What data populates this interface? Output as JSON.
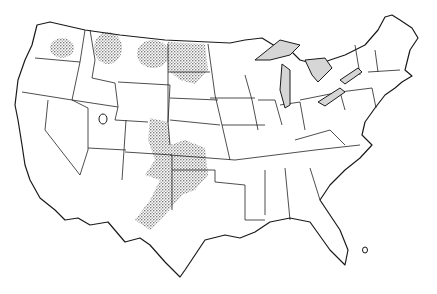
{
  "map": {
    "subject": "Contiguous United States outline map with state boundaries",
    "style": "black and white line drawing",
    "shaded_features": [
      {
        "name": "Great Lakes",
        "fill": "light gray hatched"
      },
      {
        "name": "Lake Champlain / Lake Ontario region",
        "fill": "light gray hatched"
      }
    ],
    "stippled_regions": [
      {
        "name": "Eastern Washington"
      },
      {
        "name": "Northwestern Montana"
      },
      {
        "name": "Northeastern Montana"
      },
      {
        "name": "North Dakota / northern South Dakota"
      },
      {
        "name": "Eastern Colorado"
      },
      {
        "name": "Western Kansas"
      },
      {
        "name": "Oklahoma / Texas Panhandle"
      },
      {
        "name": "Eastern New Mexico"
      }
    ],
    "other_marks": [
      {
        "name": "Great Salt Lake outline (Utah)"
      },
      {
        "name": "Lake Okeechobee outline (Florida)"
      }
    ],
    "colors": {
      "line": "#1a1a1a",
      "lake_fill": "#d6d6d6",
      "background": "#ffffff"
    }
  }
}
